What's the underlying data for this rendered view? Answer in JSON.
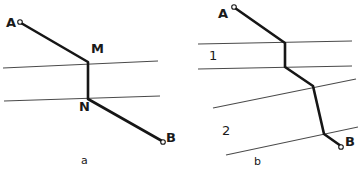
{
  "figure": {
    "width": 358,
    "height": 178,
    "background_color": "#ffffff",
    "ray_color": "#161616",
    "boundary_color": "#4a4a4a",
    "panels": [
      {
        "id": "panel-a",
        "caption": "a",
        "caption_pos": {
          "x": 81,
          "y": 155
        },
        "point_labels": [
          {
            "name": "A",
            "text": "A",
            "x": 6,
            "y": 16
          },
          {
            "name": "M",
            "text": "M",
            "x": 91,
            "y": 42
          },
          {
            "name": "N",
            "text": "N",
            "x": 79,
            "y": 100
          },
          {
            "name": "B",
            "text": "B",
            "x": 166,
            "y": 131
          }
        ],
        "boundaries": [
          {
            "name": "boundary-upper",
            "x1": 3,
            "y1": 68,
            "x2": 158,
            "y2": 61
          },
          {
            "name": "boundary-lower",
            "x1": 4,
            "y1": 101,
            "x2": 160,
            "y2": 96
          }
        ],
        "ray_path": "M 21,23 L 88,62 L 88,99 L 162,141",
        "endpoints": [
          {
            "name": "endpoint-a",
            "x": 20,
            "y": 22,
            "r": 2.3
          },
          {
            "name": "endpoint-b",
            "x": 163,
            "y": 142,
            "r": 2.3
          }
        ]
      },
      {
        "id": "panel-b",
        "caption": "b",
        "caption_pos": {
          "x": 254,
          "y": 156
        },
        "point_labels": [
          {
            "name": "A",
            "text": "A",
            "x": 218,
            "y": 7
          },
          {
            "name": "B",
            "text": "B",
            "x": 345,
            "y": 135
          },
          {
            "name": "medium-1",
            "text": "1",
            "x": 209,
            "y": 49
          },
          {
            "name": "medium-2",
            "text": "2",
            "x": 222,
            "y": 124
          }
        ],
        "boundaries": [
          {
            "name": "boundary-1",
            "x1": 198,
            "y1": 44,
            "x2": 352,
            "y2": 41
          },
          {
            "name": "boundary-2",
            "x1": 198,
            "y1": 69,
            "x2": 352,
            "y2": 66
          },
          {
            "name": "boundary-3",
            "x1": 213,
            "y1": 108,
            "x2": 356,
            "y2": 79
          },
          {
            "name": "boundary-4",
            "x1": 226,
            "y1": 155,
            "x2": 358,
            "y2": 127
          }
        ],
        "ray_path": "M 235,8 L 285,43 L 285,67 L 313,86 L 324,134 L 341,146",
        "endpoints": [
          {
            "name": "endpoint-a",
            "x": 234,
            "y": 7,
            "r": 2.3
          },
          {
            "name": "endpoint-b",
            "x": 341,
            "y": 147,
            "r": 2.3
          }
        ]
      }
    ]
  }
}
